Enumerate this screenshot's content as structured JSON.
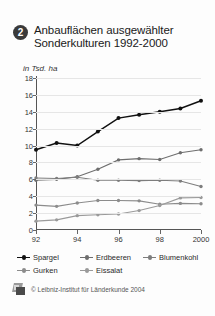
{
  "header": {
    "badge_number": "2",
    "title": "Anbauflächen ausgewählter Sonderkulturen 1992-2000"
  },
  "footer": {
    "copyright": "© Leibniz-Institut für Länderkunde 2004",
    "logo_name": "leibniz-institut-logo"
  },
  "chart_data": {
    "type": "line",
    "title": "Anbauflächen ausgewählter Sonderkulturen 1992-2000",
    "subtitle": "",
    "xlabel": "",
    "ylabel": "in Tsd. ha",
    "unit_label": "in Tsd. ha",
    "grid": true,
    "legend_position": "bottom",
    "x": [
      1992,
      1993,
      1994,
      1995,
      1996,
      1997,
      1998,
      1999,
      2000
    ],
    "categories": [
      "92",
      "93",
      "94",
      "95",
      "96",
      "97",
      "98",
      "99",
      "2000"
    ],
    "tick_labels_x": [
      "92",
      "94",
      "96",
      "98",
      "2000"
    ],
    "tick_values_x": [
      1992,
      1994,
      1996,
      1998,
      2000
    ],
    "tick_labels_y": [
      "0",
      "2",
      "4",
      "6",
      "8",
      "10",
      "12",
      "14",
      "16",
      "18"
    ],
    "tick_values_y": [
      0,
      2,
      4,
      6,
      8,
      10,
      12,
      14,
      16,
      18
    ],
    "ylim": [
      0,
      18
    ],
    "xlim": [
      1992,
      2000
    ],
    "series": [
      {
        "name": "Spargel",
        "color": "#111111",
        "values": [
          9.5,
          10.3,
          10.0,
          11.65,
          13.25,
          13.65,
          14.0,
          14.4,
          15.3
        ]
      },
      {
        "name": "Erdbeeren",
        "color": "#6e6e6e",
        "values": [
          5.9,
          6.0,
          6.3,
          7.2,
          8.3,
          8.45,
          8.35,
          9.15,
          9.5
        ]
      },
      {
        "name": "Blumenkohl",
        "color": "#7d7d7d",
        "values": [
          6.15,
          6.1,
          6.25,
          5.9,
          5.9,
          5.85,
          5.9,
          5.8,
          5.15
        ]
      },
      {
        "name": "Gurken",
        "color": "#8c8c8c",
        "values": [
          2.95,
          2.8,
          3.2,
          3.5,
          3.5,
          3.45,
          3.05,
          3.15,
          3.1
        ]
      },
      {
        "name": "Eissalat",
        "color": "#9a9a9a",
        "values": [
          1.05,
          1.2,
          1.7,
          1.8,
          1.9,
          2.3,
          2.9,
          3.8,
          3.85
        ]
      }
    ]
  }
}
